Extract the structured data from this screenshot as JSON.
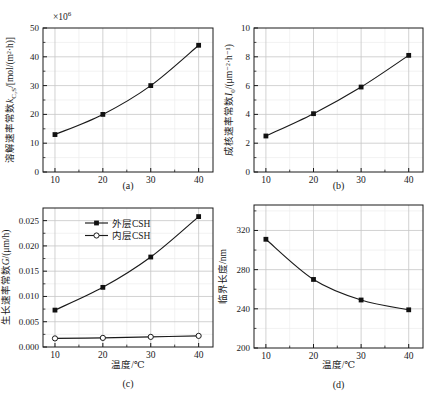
{
  "figure": {
    "background": "#ffffff",
    "axis_color": "#1a1a1a",
    "text_color": "#1a1a1a",
    "line_color": "#1a1a1a",
    "grid_color": "#c6c6c6",
    "minor_grid_color": "#ededed",
    "marker_fill": "#111111",
    "open_marker_fill": "#ffffff"
  },
  "chart_data": [
    {
      "id": "a",
      "type": "line",
      "caption": "(a)",
      "xlabel": "",
      "scale_label": [
        {
          "text": "×10"
        },
        {
          "text": "6",
          "script": "sup"
        }
      ],
      "ylabel": [
        {
          "text": "溶解速率常数"
        },
        {
          "text": "k",
          "style": "italic"
        },
        {
          "text": "C₃S",
          "script": "sub"
        },
        {
          "text": "/[mol/(m²·h)]"
        }
      ],
      "x": [
        10,
        20,
        30,
        40
      ],
      "xlim": [
        7.5,
        43
      ],
      "xticks": [
        10,
        20,
        30,
        40
      ],
      "xtick_labels": [
        "10",
        "20",
        "30",
        "40"
      ],
      "xminor": [
        15,
        25,
        35
      ],
      "ylim": [
        0,
        50
      ],
      "yticks": [
        0,
        10,
        20,
        30,
        40,
        50
      ],
      "ytick_labels": [
        "0",
        "10",
        "20",
        "30",
        "40",
        "50"
      ],
      "yminor": [
        5,
        15,
        25,
        35,
        45
      ],
      "series": [
        {
          "marker": "filled-square",
          "values": [
            13,
            20,
            30,
            44
          ]
        }
      ]
    },
    {
      "id": "b",
      "type": "line",
      "caption": "(b)",
      "xlabel": "",
      "ylabel": [
        {
          "text": "成核速率常数"
        },
        {
          "text": "I",
          "style": "italic"
        },
        {
          "text": "0",
          "script": "sub"
        },
        {
          "text": "/(μm⁻²·h⁻¹)"
        }
      ],
      "x": [
        10,
        20,
        30,
        40
      ],
      "xlim": [
        7.5,
        43
      ],
      "xticks": [
        10,
        20,
        30,
        40
      ],
      "xtick_labels": [
        "10",
        "20",
        "30",
        "40"
      ],
      "xminor": [
        15,
        25,
        35
      ],
      "ylim": [
        0,
        10
      ],
      "yticks": [
        0,
        2,
        4,
        6,
        8,
        10
      ],
      "ytick_labels": [
        "0",
        "2",
        "4",
        "6",
        "8",
        "10"
      ],
      "yminor": [
        1,
        3,
        5,
        7,
        9
      ],
      "series": [
        {
          "marker": "filled-square",
          "values": [
            2.5,
            4.05,
            5.9,
            8.1
          ]
        }
      ]
    },
    {
      "id": "c",
      "type": "line",
      "caption": "(c)",
      "xlabel": "温度/℃",
      "ylabel": [
        {
          "text": "生长速率常数"
        },
        {
          "text": "G",
          "style": "italic"
        },
        {
          "text": "/(μm/h)"
        }
      ],
      "x": [
        10,
        20,
        30,
        40
      ],
      "xlim": [
        7.5,
        43
      ],
      "xticks": [
        10,
        20,
        30,
        40
      ],
      "xtick_labels": [
        "10",
        "20",
        "30",
        "40"
      ],
      "xminor": [
        15,
        25,
        35
      ],
      "ylim": [
        0,
        0.0275
      ],
      "yticks": [
        0,
        0.005,
        0.01,
        0.015,
        0.02,
        0.025
      ],
      "ytick_labels": [
        "0.000",
        "0.005",
        "0.010",
        "0.015",
        "0.020",
        "0.025"
      ],
      "yminor": [
        0.0025,
        0.0075,
        0.0125,
        0.0175,
        0.0225
      ],
      "legend": true,
      "series": [
        {
          "name": "外层CSH",
          "marker": "filled-square",
          "values": [
            0.0073,
            0.0118,
            0.0178,
            0.0258
          ]
        },
        {
          "name": "内层CSH",
          "marker": "open-circle",
          "values": [
            0.0017,
            0.0018,
            0.002,
            0.0022
          ]
        }
      ]
    },
    {
      "id": "d",
      "type": "line",
      "caption": "(d)",
      "xlabel": "温度/℃",
      "ylabel": [
        {
          "text": "临界长度/nm"
        }
      ],
      "x": [
        10,
        20,
        30,
        40
      ],
      "xlim": [
        7.5,
        43
      ],
      "xticks": [
        10,
        20,
        30,
        40
      ],
      "xtick_labels": [
        "10",
        "20",
        "30",
        "40"
      ],
      "xminor": [
        15,
        25,
        35
      ],
      "ylim": [
        200,
        346
      ],
      "yticks": [
        200,
        240,
        280,
        320
      ],
      "ytick_labels": [
        "200",
        "240",
        "280",
        "320"
      ],
      "yminor": [
        220,
        260,
        300,
        340
      ],
      "series": [
        {
          "marker": "filled-square",
          "values": [
            311,
            270,
            249,
            239
          ]
        }
      ]
    }
  ]
}
